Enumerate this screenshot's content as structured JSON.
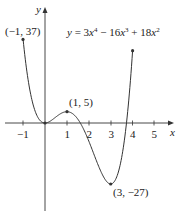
{
  "chart_data": {
    "type": "line",
    "function": "3x^4 - 16x^3 + 18x^2",
    "xlabel": "x",
    "ylabel": "y",
    "xlim": [
      -1,
      4
    ],
    "x_ticks": [
      -1,
      1,
      2,
      3,
      4,
      5
    ],
    "grid": false,
    "points": [
      {
        "x": -1,
        "y": 37,
        "label": "(−1, 37)"
      },
      {
        "x": 0,
        "y": 0,
        "label": ""
      },
      {
        "x": 1,
        "y": 5,
        "label": "(1, 5)"
      },
      {
        "x": 3,
        "y": -27,
        "label": "(3, −27)"
      },
      {
        "x": 4,
        "y": 32,
        "label": ""
      }
    ]
  },
  "labels": {
    "equation_prefix": "y = 3x",
    "eq_exp1": "4",
    "eq_mid": " − 16x",
    "eq_exp2": "3",
    "eq_mid2": " + 18x",
    "eq_exp3": "2",
    "x_axis": "x",
    "y_axis": "y",
    "ticks": [
      "−1",
      "1",
      "2",
      "3",
      "4",
      "5"
    ],
    "pt_left": "(−1, 37)",
    "pt_local_max": "(1, 5)",
    "pt_min": "(3, −27)"
  }
}
